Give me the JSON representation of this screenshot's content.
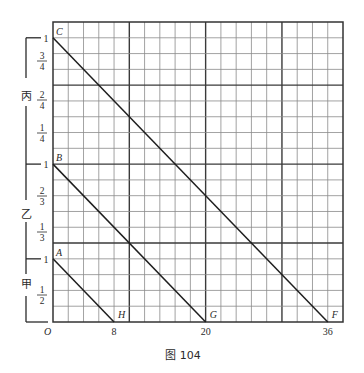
{
  "figure": {
    "caption": "图 104",
    "grid": {
      "x_left": 53,
      "x_right": 343,
      "y_top": 22,
      "y_bottom": 322,
      "cols": 19,
      "rows": 19,
      "thick_cols": [
        5,
        10,
        15
      ],
      "thick_rows_from_bottom": [
        5,
        10,
        15
      ]
    },
    "x_axis": {
      "origin_label": "O",
      "ticks": [
        {
          "label": "8",
          "col": 4
        },
        {
          "label": "20",
          "col": 10
        },
        {
          "label": "36",
          "col": 18
        }
      ]
    },
    "sections": [
      {
        "name": "丙",
        "unit_label": "1",
        "fractions": [
          {
            "num": "3",
            "den": "4",
            "y": 61
          },
          {
            "num": "2",
            "den": "4",
            "y": 100
          },
          {
            "num": "1",
            "den": "4",
            "y": 133
          }
        ],
        "label_y": 96
      },
      {
        "name": "乙",
        "unit_label": "1",
        "fractions": [
          {
            "num": "2",
            "den": "3",
            "y": 196
          },
          {
            "num": "1",
            "den": "3",
            "y": 232
          }
        ],
        "label_y": 214
      },
      {
        "name": "甲",
        "unit_label": "1",
        "fractions": [
          {
            "num": "1",
            "den": "2",
            "y": 295
          }
        ],
        "label_y": 284
      }
    ],
    "lines": [
      {
        "start": "C",
        "end": "F",
        "start_row": 18,
        "end_col": 18
      },
      {
        "start": "B",
        "end": "G",
        "start_row": 10,
        "end_col": 10
      },
      {
        "start": "A",
        "end": "H",
        "start_row": 4,
        "end_col": 4
      }
    ],
    "point_labels": {
      "A": "A",
      "B": "B",
      "C": "C",
      "F": "F",
      "G": "G",
      "H": "H"
    },
    "colors": {
      "grid_thin": "#8a8a8a",
      "grid_thick": "#3a3a3a",
      "line": "#1e1e1e",
      "background": "#ffffff"
    }
  }
}
